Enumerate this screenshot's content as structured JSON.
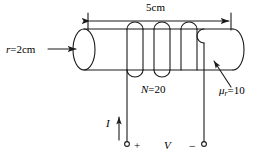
{
  "figure": {
    "labels": {
      "length": "5cm",
      "radius_symbol": "r",
      "radius_value": "=2cm",
      "turns_symbol": "N",
      "turns_value": "=20",
      "permeability_symbol": "μ",
      "permeability_subscript": "r",
      "permeability_value": "=10",
      "current_symbol": "I",
      "voltage_symbol": "V",
      "polarity_positive": "+",
      "polarity_negative": "−"
    },
    "geometry": {
      "core_left_x": 84,
      "core_right_x": 233,
      "core_top_y": 29,
      "core_bottom_y": 70,
      "core_ellipse_rx": 11,
      "core_ellipse_ry": 20.5,
      "dimension_line_y": 21,
      "dimension_left_tick_x": 88,
      "dimension_right_tick_x": 231,
      "coil_arc_count": 3,
      "lead_left_x": 127,
      "lead_right_x": 204,
      "terminal_y": 144,
      "terminal_radius": 2.4
    },
    "style": {
      "stroke_color": "#1a1a1a",
      "background_color": "#ffffff",
      "stroke_width": 1.1
    }
  }
}
